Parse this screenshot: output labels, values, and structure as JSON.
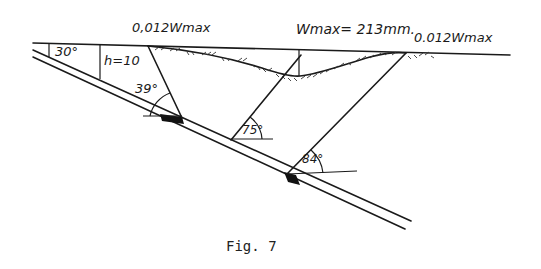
{
  "figure": {
    "caption": "Fig. 7",
    "labels": {
      "left_limit": "0,012Wmax",
      "wmax": "Wmax= 213mm.",
      "right_limit": "0.012Wmax",
      "seam_dip": "30°",
      "depth": "h=10",
      "angle_left": "39°",
      "angle_center": "75°",
      "angle_right": "84°"
    }
  }
}
